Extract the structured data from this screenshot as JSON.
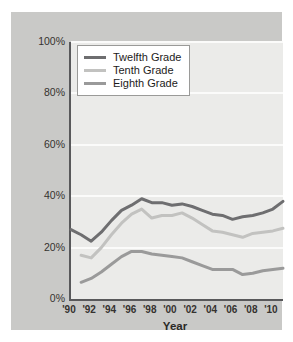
{
  "chart_data": {
    "type": "line",
    "title": "",
    "xlabel": "Year",
    "ylabel": "",
    "ylim": [
      0,
      100
    ],
    "xlim": [
      1990,
      2011
    ],
    "grid": true,
    "legend_position": "top-left",
    "y_ticks": [
      "0%",
      "20%",
      "40%",
      "60%",
      "80%",
      "100%"
    ],
    "y_tick_values": [
      0,
      20,
      40,
      60,
      80,
      100
    ],
    "x_ticks": [
      "'90",
      "'92",
      "'94",
      "'96",
      "'98",
      "'00",
      "'02",
      "'04",
      "'06",
      "'08",
      "'10"
    ],
    "x_tick_values": [
      1990,
      1992,
      1994,
      1996,
      1998,
      2000,
      2002,
      2004,
      2006,
      2008,
      2010
    ],
    "x": [
      1990,
      1991,
      1992,
      1993,
      1994,
      1995,
      1996,
      1997,
      1998,
      1999,
      2000,
      2001,
      2002,
      2003,
      2004,
      2005,
      2006,
      2007,
      2008,
      2009,
      2010,
      2011
    ],
    "series": [
      {
        "name": "Twelfth Grade",
        "color": "#6e6e70",
        "values": [
          27.0,
          25.0,
          22.5,
          26.0,
          30.5,
          34.5,
          36.5,
          39.0,
          37.5,
          37.5,
          36.5,
          37.0,
          36.0,
          34.5,
          33.0,
          32.5,
          31.0,
          32.0,
          32.5,
          33.5,
          35.0,
          38.0
        ]
      },
      {
        "name": "Tenth Grade",
        "color": "#c2c2c0",
        "values": [
          null,
          17.0,
          16.0,
          20.0,
          25.0,
          29.5,
          33.0,
          35.0,
          31.5,
          32.5,
          32.5,
          33.5,
          31.5,
          29.0,
          26.5,
          26.0,
          25.0,
          24.0,
          25.5,
          26.0,
          26.5,
          27.5
        ]
      },
      {
        "name": "Eighth Grade",
        "color": "#9a9a9a",
        "values": [
          null,
          6.5,
          8.0,
          10.5,
          13.5,
          16.5,
          18.5,
          18.5,
          17.5,
          17.0,
          16.5,
          16.0,
          14.5,
          13.0,
          11.5,
          11.5,
          11.5,
          9.5,
          10.0,
          11.0,
          11.5,
          12.0
        ]
      }
    ]
  },
  "legend": {
    "items": [
      {
        "label": "Twelfth Grade",
        "color": "#6e6e70"
      },
      {
        "label": "Tenth Grade",
        "color": "#c2c2c0"
      },
      {
        "label": "Eighth Grade",
        "color": "#9a9a9a"
      }
    ]
  },
  "axis": {
    "x_title": "Year"
  }
}
